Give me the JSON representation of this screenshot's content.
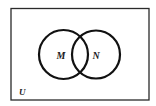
{
  "diagram": {
    "type": "venn",
    "universe": {
      "label": "U",
      "rect": {
        "x": 11,
        "y": 8.5,
        "width": 138,
        "height": 91.5
      },
      "stroke": "#2a2a2a"
    },
    "sets": [
      {
        "label": "M",
        "cx": 63.5,
        "cy": 54.5,
        "r": 24.5,
        "stroke": "#111111"
      },
      {
        "label": "N",
        "cx": 96,
        "cy": 54.5,
        "r": 24,
        "stroke": "#111111"
      }
    ]
  }
}
